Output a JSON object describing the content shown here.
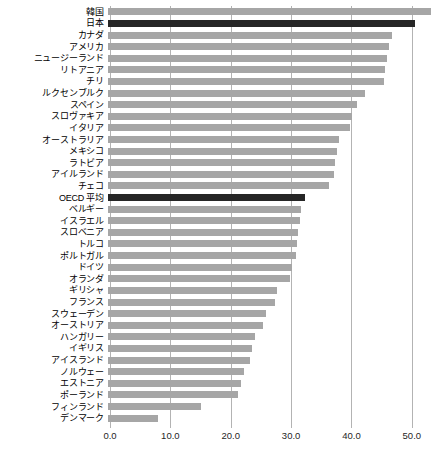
{
  "chart_data": {
    "type": "bar",
    "orientation": "horizontal",
    "title": "",
    "xlabel": "",
    "ylabel": "",
    "xlim": [
      0.0,
      54.5
    ],
    "grid": true,
    "legend": null,
    "xticks": [
      "0.0",
      "10.0",
      "20.0",
      "30.0",
      "40.0",
      "50.0"
    ],
    "xtick_values": [
      0,
      10,
      20,
      30,
      40,
      50
    ],
    "highlight_color": "#262626",
    "bar_color": "#a6a6a6",
    "categories": [
      "韓国",
      "日本",
      "カナダ",
      "アメリカ",
      "ニュージーランド",
      "リトアニア",
      "チリ",
      "ルクセンブルク",
      "スペイン",
      "スロヴァキア",
      "イタリア",
      "オーストラリア",
      "メキシコ",
      "ラトビア",
      "アイルランド",
      "チェコ",
      "OECD 平均",
      "ベルギー",
      "イスラエル",
      "スロベニア",
      "トルコ",
      "ポルトガル",
      "ドイツ",
      "オランダ",
      "ギリシャ",
      "フランス",
      "スウェーデン",
      "オーストリア",
      "ハンガリー",
      "イギリス",
      "アイスランド",
      "ノルウェー",
      "エストニア",
      "ポーランド",
      "フィンランド",
      "デンマーク"
    ],
    "values": [
      53.5,
      50.8,
      47.0,
      46.5,
      46.2,
      45.9,
      45.7,
      42.6,
      41.3,
      40.4,
      40.1,
      38.3,
      37.9,
      37.6,
      37.4,
      36.6,
      32.7,
      32.0,
      31.8,
      31.5,
      31.3,
      31.1,
      30.5,
      30.2,
      28.0,
      27.7,
      26.2,
      25.7,
      24.3,
      23.9,
      23.5,
      22.6,
      22.0,
      21.6,
      15.4,
      8.3
    ],
    "highlighted": [
      "日本",
      "OECD 平均"
    ]
  }
}
